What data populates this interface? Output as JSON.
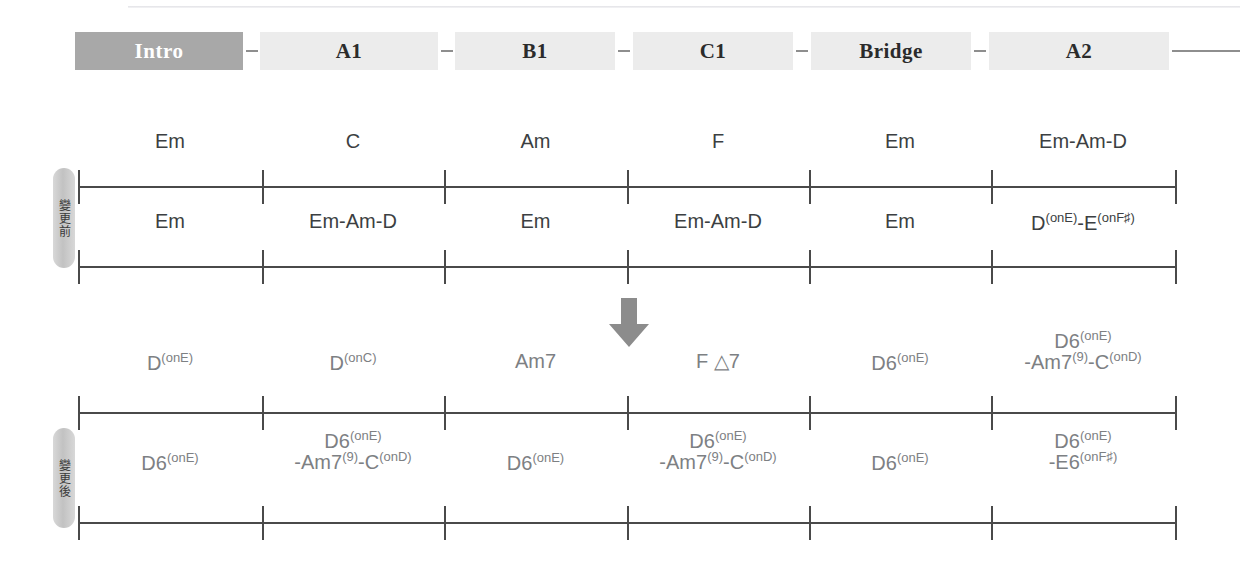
{
  "document": {
    "title": "Song Section Chord Progression Chart",
    "language": "zh-TW"
  },
  "timeline": {
    "sections": [
      {
        "label": "Intro",
        "style": "filled",
        "left": 75,
        "width": 168
      },
      {
        "label": "A1",
        "style": "plain",
        "left": 260,
        "width": 178
      },
      {
        "label": "B1",
        "style": "plain",
        "left": 455,
        "width": 160
      },
      {
        "label": "C1",
        "style": "plain",
        "left": 633,
        "width": 160
      },
      {
        "label": "Bridge",
        "style": "plain",
        "left": 811,
        "width": 160
      },
      {
        "label": "A2",
        "style": "plain",
        "left": 989,
        "width": 180
      }
    ],
    "connectors": [
      {
        "left": 246,
        "width": 12
      },
      {
        "left": 441,
        "width": 12
      },
      {
        "left": 618,
        "width": 12
      },
      {
        "left": 796,
        "width": 12
      },
      {
        "left": 974,
        "width": 12
      },
      {
        "left": 1172,
        "width": 68
      }
    ]
  },
  "side_labels": [
    {
      "name": "before",
      "text": "變更前",
      "top": 168,
      "height": 100
    },
    {
      "name": "after",
      "text": "變更後",
      "top": 428,
      "height": 100
    }
  ],
  "arrow": {
    "name": "downward-transform-arrow",
    "color": "#8c8c8c"
  },
  "systems": [
    {
      "name": "before-row-1",
      "group": "before",
      "staff_top": 186,
      "label_top": 131,
      "text_color": "dark",
      "measures": [
        {
          "index": 1,
          "lines": [
            {
              "parts": [
                {
                  "t": "Em",
                  "k": "base"
                }
              ]
            }
          ]
        },
        {
          "index": 2,
          "lines": [
            {
              "parts": [
                {
                  "t": "C",
                  "k": "base"
                }
              ]
            }
          ]
        },
        {
          "index": 3,
          "lines": [
            {
              "parts": [
                {
                  "t": "Am",
                  "k": "base"
                }
              ]
            }
          ]
        },
        {
          "index": 4,
          "lines": [
            {
              "parts": [
                {
                  "t": "F",
                  "k": "base"
                }
              ]
            }
          ]
        },
        {
          "index": 5,
          "lines": [
            {
              "parts": [
                {
                  "t": "Em",
                  "k": "base"
                }
              ]
            }
          ]
        },
        {
          "index": 6,
          "lines": [
            {
              "parts": [
                {
                  "t": "Em-Am-D",
                  "k": "base"
                }
              ]
            }
          ]
        }
      ]
    },
    {
      "name": "before-row-2",
      "group": "before",
      "staff_top": 266,
      "label_top": 211,
      "text_color": "dark",
      "measures": [
        {
          "index": 1,
          "lines": [
            {
              "parts": [
                {
                  "t": "Em",
                  "k": "base"
                }
              ]
            }
          ]
        },
        {
          "index": 2,
          "lines": [
            {
              "parts": [
                {
                  "t": "Em-Am-D",
                  "k": "base"
                }
              ]
            }
          ]
        },
        {
          "index": 3,
          "lines": [
            {
              "parts": [
                {
                  "t": "Em",
                  "k": "base"
                }
              ]
            }
          ]
        },
        {
          "index": 4,
          "lines": [
            {
              "parts": [
                {
                  "t": "Em-Am-D",
                  "k": "base"
                }
              ]
            }
          ]
        },
        {
          "index": 5,
          "lines": [
            {
              "parts": [
                {
                  "t": "Em",
                  "k": "base"
                }
              ]
            }
          ]
        },
        {
          "index": 6,
          "lines": [
            {
              "parts": [
                {
                  "t": "D",
                  "k": "base"
                },
                {
                  "t": "(onE)",
                  "k": "sup"
                },
                {
                  "t": "-E",
                  "k": "base"
                },
                {
                  "t": "(onF♯)",
                  "k": "sup"
                }
              ]
            }
          ]
        }
      ]
    },
    {
      "name": "after-row-1",
      "group": "after",
      "staff_top": 412,
      "label_top": 351,
      "text_color": "light",
      "measures": [
        {
          "index": 1,
          "lines": [
            {
              "parts": [
                {
                  "t": "D",
                  "k": "base"
                },
                {
                  "t": "(onE)",
                  "k": "sup"
                }
              ]
            }
          ]
        },
        {
          "index": 2,
          "lines": [
            {
              "parts": [
                {
                  "t": "D",
                  "k": "base"
                },
                {
                  "t": "(onC)",
                  "k": "sup"
                }
              ]
            }
          ]
        },
        {
          "index": 3,
          "lines": [
            {
              "parts": [
                {
                  "t": "Am7",
                  "k": "base"
                }
              ]
            }
          ]
        },
        {
          "index": 4,
          "lines": [
            {
              "parts": [
                {
                  "t": "F △7",
                  "k": "base"
                }
              ]
            }
          ]
        },
        {
          "index": 5,
          "lines": [
            {
              "parts": [
                {
                  "t": "D6",
                  "k": "base"
                },
                {
                  "t": "(onE)",
                  "k": "sup"
                }
              ]
            }
          ]
        },
        {
          "index": 6,
          "lines": [
            {
              "parts": [
                {
                  "t": "D6",
                  "k": "base"
                },
                {
                  "t": "(onE)",
                  "k": "sup"
                }
              ]
            },
            {
              "parts": [
                {
                  "t": "-Am7",
                  "k": "base"
                },
                {
                  "t": "(9)",
                  "k": "sup"
                },
                {
                  "t": "-C",
                  "k": "base"
                },
                {
                  "t": "(onD)",
                  "k": "sup"
                }
              ]
            }
          ]
        }
      ]
    },
    {
      "name": "after-row-2",
      "group": "after",
      "staff_top": 522,
      "label_top": 451,
      "text_color": "light",
      "measures": [
        {
          "index": 1,
          "lines": [
            {
              "parts": [
                {
                  "t": "D6",
                  "k": "base"
                },
                {
                  "t": "(onE)",
                  "k": "sup"
                }
              ]
            }
          ]
        },
        {
          "index": 2,
          "lines": [
            {
              "parts": [
                {
                  "t": "D6",
                  "k": "base"
                },
                {
                  "t": "(onE)",
                  "k": "sup"
                }
              ]
            },
            {
              "parts": [
                {
                  "t": "-Am7",
                  "k": "base"
                },
                {
                  "t": "(9)",
                  "k": "sup"
                },
                {
                  "t": "-C",
                  "k": "base"
                },
                {
                  "t": "(onD)",
                  "k": "sup"
                }
              ]
            }
          ]
        },
        {
          "index": 3,
          "lines": [
            {
              "parts": [
                {
                  "t": "D6",
                  "k": "base"
                },
                {
                  "t": "(onE)",
                  "k": "sup"
                }
              ]
            }
          ]
        },
        {
          "index": 4,
          "lines": [
            {
              "parts": [
                {
                  "t": "D6",
                  "k": "base"
                },
                {
                  "t": "(onE)",
                  "k": "sup"
                }
              ]
            },
            {
              "parts": [
                {
                  "t": "-Am7",
                  "k": "base"
                },
                {
                  "t": "(9)",
                  "k": "sup"
                },
                {
                  "t": "-C",
                  "k": "base"
                },
                {
                  "t": "(onD)",
                  "k": "sup"
                }
              ]
            }
          ]
        },
        {
          "index": 5,
          "lines": [
            {
              "parts": [
                {
                  "t": "D6",
                  "k": "base"
                },
                {
                  "t": "(onE)",
                  "k": "sup"
                }
              ]
            }
          ]
        },
        {
          "index": 6,
          "lines": [
            {
              "parts": [
                {
                  "t": "D6",
                  "k": "base"
                },
                {
                  "t": "(onE)",
                  "k": "sup"
                }
              ]
            },
            {
              "parts": [
                {
                  "t": "-E6",
                  "k": "base"
                },
                {
                  "t": "(onF♯)",
                  "k": "sup"
                }
              ]
            }
          ]
        }
      ]
    }
  ],
  "staff_geometry": {
    "left": 78,
    "width": 1097,
    "measure_count": 6,
    "barline_positions": [
      78,
      262,
      444,
      627,
      809,
      991,
      1175
    ]
  },
  "colors": {
    "staff": "#4a4a4a",
    "chord_dark": "#3c3f42",
    "chord_light": "#7d8083",
    "section_filled_bg": "#a8a8a8",
    "section_plain_bg": "#ececec",
    "arrow": "#8c8c8c",
    "side_label_bg": "#c8c8c8"
  }
}
